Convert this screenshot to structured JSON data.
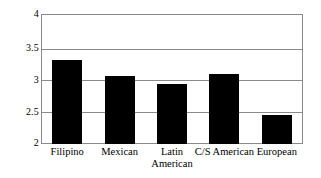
{
  "chart_data": {
    "type": "bar",
    "title": "",
    "subtitle": "",
    "xlabel": "",
    "ylabel": "",
    "categories": [
      "Filipino",
      "Mexican",
      "Latin American",
      "C/S American",
      "European"
    ],
    "category_lines": [
      [
        "Filipino"
      ],
      [
        "Mexican"
      ],
      [
        "Latin",
        "American"
      ],
      [
        "C/S American"
      ],
      [
        "European"
      ]
    ],
    "values": [
      3.29,
      3.05,
      2.92,
      3.07,
      2.45
    ],
    "ylim": [
      2,
      4
    ],
    "ytick_values": [
      4,
      3.5,
      3,
      2.5,
      2
    ],
    "ytick_labels": [
      "4",
      "3.5",
      "3",
      "2.5",
      "2"
    ],
    "grid": true,
    "grid_axis": "y",
    "legend": false,
    "legend_position": "none",
    "bar_color": "#000000",
    "frame_color": "#8a8a8a",
    "background_color": "#ffffff"
  }
}
